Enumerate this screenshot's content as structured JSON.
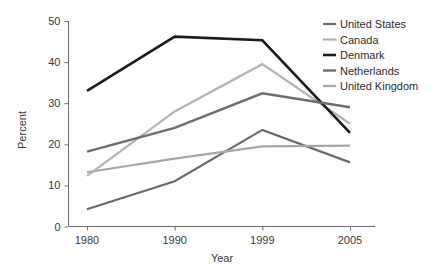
{
  "chart_data": {
    "type": "line",
    "title": "",
    "xlabel": "Year",
    "ylabel": "Percent",
    "categories": [
      "1980",
      "1990",
      "1999",
      "2005"
    ],
    "x": [
      1980,
      1990,
      1999,
      2005
    ],
    "ylim": [
      0,
      50
    ],
    "yticks": [
      0,
      10,
      20,
      30,
      40,
      50
    ],
    "ytick_labels": [
      "0",
      "10",
      "20",
      "30",
      "40",
      "50"
    ],
    "xtick_labels": [
      "1980",
      "1990",
      "1999",
      "2005"
    ],
    "grid": false,
    "legend_position": "top-right",
    "x_scale": "categorical-even-spacing",
    "series": [
      {
        "name": "United States",
        "values": [
          4.2,
          11.0,
          23.5,
          15.6
        ],
        "color": "#6b6b6b",
        "line_width": 2.2
      },
      {
        "name": "Canada",
        "values": [
          12.3,
          28.0,
          39.5,
          25.0
        ],
        "color": "#b4b4b4",
        "line_width": 2.2
      },
      {
        "name": "Denmark",
        "values": [
          33.0,
          46.2,
          45.3,
          22.8
        ],
        "color": "#1c1c1c",
        "line_width": 2.6
      },
      {
        "name": "Netherlands",
        "values": [
          18.2,
          24.0,
          32.4,
          29.0
        ],
        "color": "#6e6e6e",
        "line_width": 2.4
      },
      {
        "name": "United Kingdom",
        "values": [
          13.2,
          16.5,
          19.5,
          19.7
        ],
        "color": "#a8a8a8",
        "line_width": 2.2
      }
    ]
  },
  "legend": {
    "entries": [
      {
        "label": "United States"
      },
      {
        "label": "Canada"
      },
      {
        "label": "Denmark"
      },
      {
        "label": "Netherlands"
      },
      {
        "label": "United Kingdom"
      }
    ]
  },
  "axes": {
    "y_axis_title": "Percent",
    "x_axis_title": "Year"
  }
}
